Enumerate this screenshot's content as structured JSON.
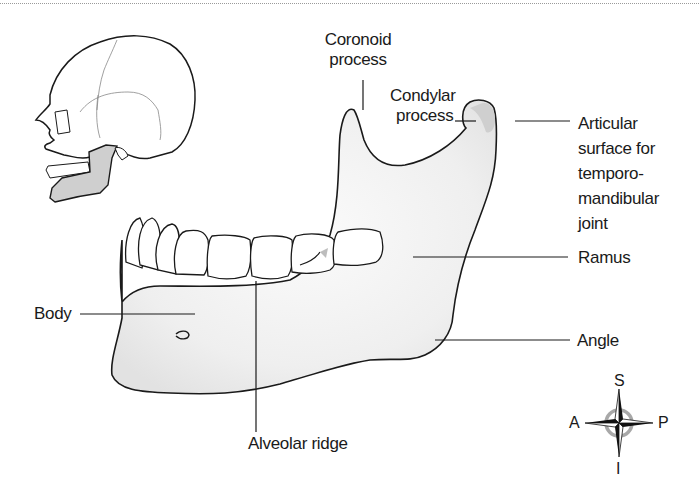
{
  "figure": {
    "labels": {
      "coronoid": [
        "Coronoid",
        "process"
      ],
      "condylar": [
        "Condylar",
        "process"
      ],
      "articular": [
        "Articular",
        "surface for",
        "temporo-",
        "mandibular",
        "joint"
      ],
      "ramus": "Ramus",
      "body": "Body",
      "angle": "Angle",
      "alveolar": "Alveolar ridge"
    },
    "inset": {
      "description": "skull-lateral-view-with-mandible-highlighted"
    },
    "compass": {
      "superior": "S",
      "inferior": "I",
      "anterior": "A",
      "posterior": "P"
    },
    "colors": {
      "bone_fill": "#f4f4f4",
      "highlight": "#cfcfcf",
      "outline": "#1a1a1a",
      "compass_ring": "#a8a8a8"
    }
  }
}
